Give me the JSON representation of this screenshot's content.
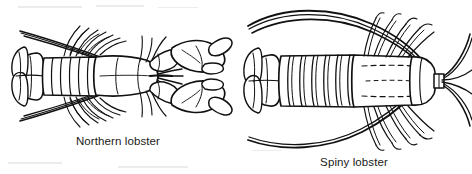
{
  "figure": {
    "kind": "scanned-line-drawing",
    "view": "dorsal",
    "background_color": "#ffffff",
    "ink_color": "#111111",
    "caption_color": "#1a1a1a",
    "specimens": [
      {
        "id": "northern",
        "caption": "Northern lobster",
        "distinguishing_features": "large pincer claws, smooth abdomen, slender antennae"
      },
      {
        "id": "spiny",
        "caption": "Spiny lobster",
        "distinguishing_features": "no large claws, heavily ridged abdomen, thick whip-like antennae"
      }
    ]
  }
}
